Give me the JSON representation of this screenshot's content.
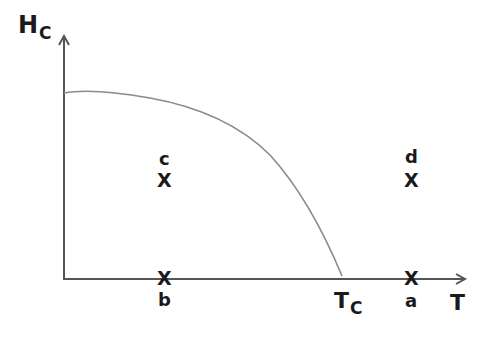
{
  "diagram": {
    "y_axis": {
      "label_main": "H",
      "label_sub": "C"
    },
    "x_axis": {
      "label": "T"
    },
    "tc_label": {
      "main": "T",
      "sub": "C"
    },
    "curve": "Hc(T) boundary from Hc(0) to Tc",
    "points": [
      {
        "id": "c",
        "marker": "X",
        "label": "c",
        "region": "below curve, T < Tc, H > 0"
      },
      {
        "id": "d",
        "marker": "X",
        "label": "d",
        "region": "above curve, T > Tc, H > 0"
      },
      {
        "id": "b",
        "marker": "X",
        "label": "b",
        "region": "on T axis, T < Tc, H = 0"
      },
      {
        "id": "a",
        "marker": "X",
        "label": "a",
        "region": "on T axis, T > Tc, H = 0"
      }
    ],
    "colors": {
      "axis": "#555555",
      "curve": "#8a8a8a",
      "text": "#1a1a1a"
    }
  }
}
